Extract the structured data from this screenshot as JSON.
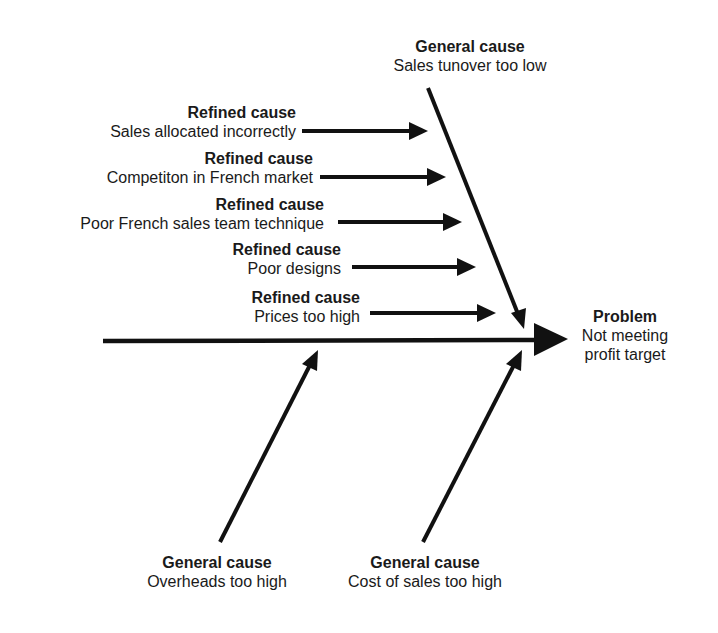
{
  "diagram": {
    "type": "fishbone",
    "problem": {
      "title": "Problem",
      "text_line1": "Not meeting",
      "text_line2": "profit target"
    },
    "general_causes": [
      {
        "title": "General cause",
        "text": "Sales tunover too low"
      },
      {
        "title": "General cause",
        "text": "Overheads too high"
      },
      {
        "title": "General cause",
        "text": "Cost of sales too high"
      }
    ],
    "refined_causes": [
      {
        "title": "Refined cause",
        "text": "Sales allocated incorrectly"
      },
      {
        "title": "Refined cause",
        "text": "Competiton in French market"
      },
      {
        "title": "Refined cause",
        "text": "Poor French sales team technique"
      },
      {
        "title": "Refined cause",
        "text": "Poor designs"
      },
      {
        "title": "Refined cause",
        "text": "Prices too high"
      }
    ],
    "colors": {
      "stroke": "#111111",
      "text": "#1a1a1a",
      "background": "#ffffff"
    }
  }
}
